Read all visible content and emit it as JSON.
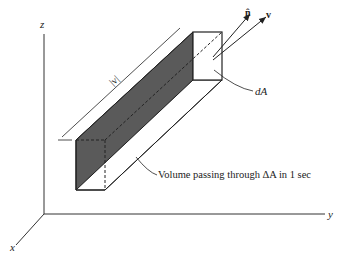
{
  "diagram": {
    "axes": {
      "x": "x",
      "y": "y",
      "z": "z"
    },
    "vectors": {
      "normal": "n̂",
      "velocity": "v"
    },
    "labels": {
      "speed": "|v|",
      "area": "dA",
      "volume": "Volume passing through ΔA in 1 sec"
    },
    "colors": {
      "shade": "#555555",
      "line": "#222222",
      "background": "#ffffff"
    }
  }
}
